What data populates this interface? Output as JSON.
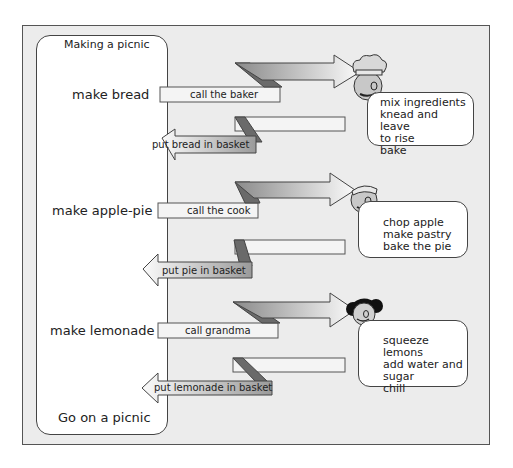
{
  "diagram": {
    "lane_title": "Making a picnic",
    "lane_end": "Go on a picnic",
    "rows": [
      {
        "task": "make bread",
        "call": "call the baker",
        "return": "put bread in basket",
        "actor": "baker-icon",
        "steps": [
          "mix ingredients",
          "knead and leave",
          "to rise",
          "bake"
        ]
      },
      {
        "task": "make apple-pie",
        "call": "call the cook",
        "return": "put pie in basket",
        "actor": "cook-icon",
        "steps": [
          "chop apple",
          "make pastry",
          "bake the pie"
        ]
      },
      {
        "task": "make lemonade",
        "call": "call grandma",
        "return": "put lemonade in basket",
        "actor": "grandma-icon",
        "steps": [
          "squeeze lemons",
          "add water and",
          "sugar",
          "chill"
        ]
      }
    ]
  },
  "colors": {
    "frame_bg": "#ececec",
    "border": "#444444",
    "arrow_dark": "#6a6a6a",
    "arrow_light": "#f4f4f4"
  }
}
